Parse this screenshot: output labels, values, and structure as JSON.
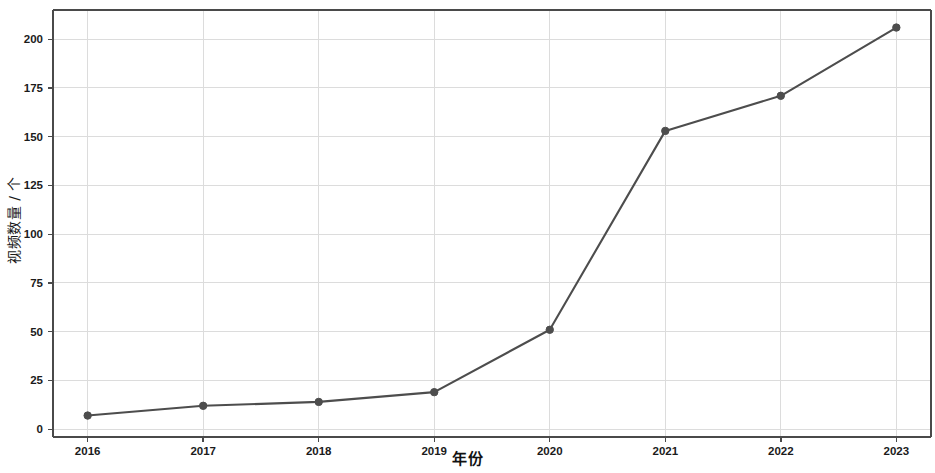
{
  "chart_data": {
    "type": "line",
    "title": "",
    "subtitle": "",
    "xlabel": "年份",
    "ylabel": "视频数量 / 个",
    "categories": [
      "2016",
      "2017",
      "2018",
      "2019",
      "2020",
      "2021",
      "2022",
      "2023"
    ],
    "x": [
      2016,
      2017,
      2018,
      2019,
      2020,
      2021,
      2022,
      2023
    ],
    "values": [
      7,
      12,
      14,
      19,
      51,
      153,
      171,
      206
    ],
    "series": [
      {
        "name": "视频数量",
        "values": [
          7,
          12,
          14,
          19,
          51,
          153,
          171,
          206
        ]
      }
    ],
    "xlim": [
      2015.7,
      2023.3
    ],
    "ylim": [
      -4,
      215
    ],
    "yticks": [
      0,
      25,
      50,
      75,
      100,
      125,
      150,
      175,
      200
    ],
    "ytick_labels": [
      "0",
      "25",
      "50",
      "75",
      "100",
      "125",
      "150",
      "175",
      "200"
    ],
    "xticks": [
      2016,
      2017,
      2018,
      2019,
      2020,
      2021,
      2022,
      2023
    ],
    "xtick_labels": [
      "2016",
      "2017",
      "2018",
      "2019",
      "2020",
      "2021",
      "2022",
      "2023"
    ],
    "grid": true,
    "grid_axis": "both",
    "legend": false,
    "legend_position": "none",
    "marker": "circle",
    "line_color": "#4d4d4d",
    "marker_color": "#4d4d4d",
    "grid_color": "#dcdcdc",
    "axis_color": "#4a4a4a",
    "background_color": "#ffffff",
    "annotations": []
  }
}
